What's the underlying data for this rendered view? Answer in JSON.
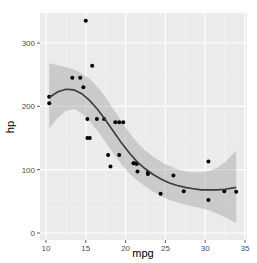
{
  "chart_data": {
    "type": "scatter",
    "title": "",
    "xlabel": "mpg",
    "ylabel": "hp",
    "xlim": [
      9.2,
      35.2
    ],
    "ylim": [
      -11,
      350
    ],
    "x_ticks": [
      10,
      15,
      20,
      25,
      30,
      35
    ],
    "y_ticks": [
      0,
      100,
      200,
      300
    ],
    "grid": true,
    "legend": "none",
    "points": {
      "x": [
        21.0,
        21.0,
        22.8,
        21.4,
        18.7,
        18.1,
        14.3,
        24.4,
        22.8,
        19.2,
        17.8,
        16.4,
        17.3,
        15.2,
        10.4,
        10.4,
        14.7,
        32.4,
        30.4,
        33.9,
        21.5,
        15.5,
        15.2,
        13.3,
        19.2,
        27.3,
        26.0,
        30.4,
        15.8,
        19.7,
        15.0,
        21.4
      ],
      "y": [
        110,
        110,
        93,
        110,
        175,
        105,
        245,
        62,
        95,
        123,
        123,
        180,
        180,
        180,
        205,
        215,
        230,
        66,
        52,
        65,
        97,
        150,
        150,
        245,
        175,
        66,
        91,
        113,
        264,
        175,
        335,
        109
      ]
    },
    "smooth": {
      "method": "loess",
      "x": [
        10.4,
        11.5,
        12.5,
        13.5,
        14.5,
        15.5,
        16.5,
        17.5,
        18.5,
        19.5,
        20.5,
        21.5,
        22.5,
        23.5,
        24.5,
        25.5,
        26.5,
        27.5,
        28.5,
        29.5,
        30.5,
        31.5,
        32.5,
        33.9
      ],
      "fit": [
        214,
        223,
        227,
        226,
        220,
        209,
        195,
        178,
        160,
        142,
        126,
        112,
        101,
        92,
        85,
        79,
        75,
        72,
        70,
        68,
        68,
        68,
        69,
        72
      ],
      "upper": [
        268,
        265,
        262,
        258,
        252,
        243,
        230,
        214,
        195,
        176,
        158,
        142,
        130,
        120,
        112,
        106,
        101,
        97,
        96,
        96,
        98,
        103,
        112,
        130
      ],
      "lower": [
        165,
        182,
        193,
        196,
        189,
        176,
        161,
        143,
        125,
        108,
        94,
        83,
        73,
        65,
        58,
        52,
        48,
        45,
        42,
        39,
        36,
        31,
        25,
        16
      ]
    },
    "colors": {
      "panel_bg": "#ebebeb",
      "grid_major": "#ffffff",
      "grid_minor": "#f5f5f5",
      "point": "#000000",
      "smooth_line": "#3a3a3a",
      "ribbon": "#999999",
      "tick_text": "#4d4d4d",
      "axis_title": "#000000"
    }
  }
}
